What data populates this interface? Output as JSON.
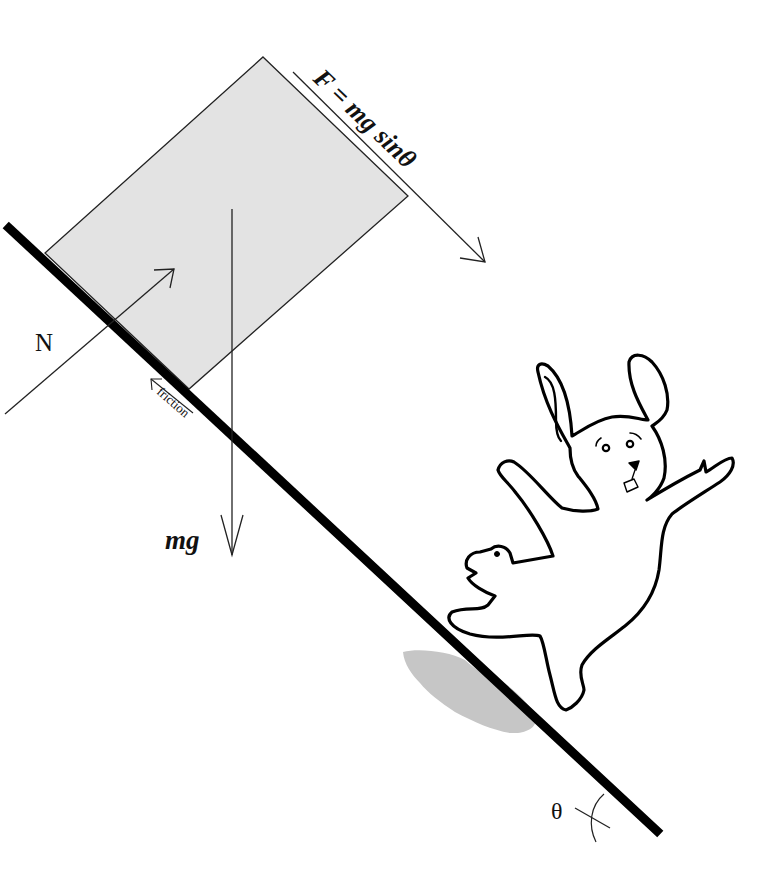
{
  "diagram": {
    "type": "free-body diagram on inclined plane",
    "colors": {
      "background": "#ffffff",
      "ink": "#111111",
      "block_fill": "#e3e3e3",
      "shadow_fill": "#c6c6c6"
    },
    "labels": {
      "force_parallel": "F = mg sinθ",
      "normal": "N",
      "weight": "mg",
      "friction": "friction",
      "angle": "θ"
    },
    "elements": {
      "incline": "thick black slope line",
      "block": "gray rectangular block resting on incline",
      "normal_arrow": "arrow perpendicular to incline pointing up-right",
      "parallel_arrow": "arrow along incline pointing down-right",
      "weight_arrow": "arrow pointing straight down",
      "friction_arrow": "small arrow along incline pointing up-left",
      "angle_arc": "arc marking incline angle",
      "bunny": "cartoon bunny falling down the slope",
      "bunny_shadow": "gray shadow under bunny"
    }
  }
}
